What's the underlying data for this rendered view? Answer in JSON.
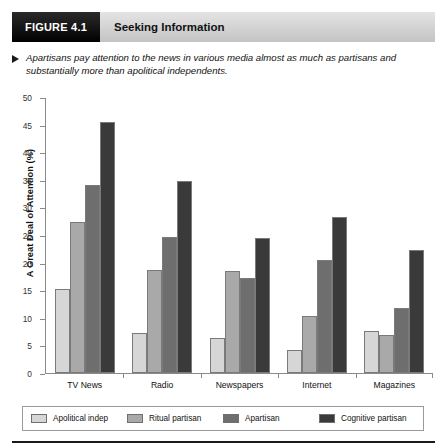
{
  "figure": {
    "tag": "FIGURE 4.1",
    "title": "Seeking Information",
    "caption": "Apartisans pay attention to the news in various media almost as much as partisans and substantially more than apolitical independents."
  },
  "chart_data": {
    "type": "bar",
    "title": "Seeking Information",
    "xlabel": "",
    "ylabel": "A Great Deal of Attention (%)",
    "ylim": [
      0,
      50
    ],
    "yticks": [
      0,
      5,
      10,
      15,
      20,
      25,
      30,
      35,
      40,
      45,
      50
    ],
    "grid": false,
    "legend_position": "bottom",
    "categories": [
      "TV News",
      "Radio",
      "Newspapers",
      "Internet",
      "Magazines"
    ],
    "series": [
      {
        "name": "Apolitical indep",
        "color": "#d6d6d6",
        "values": [
          15.3,
          7.3,
          6.3,
          4.2,
          7.7
        ]
      },
      {
        "name": "Ritual partisan",
        "color": "#a9a9a9",
        "values": [
          27.3,
          18.7,
          18.4,
          10.3,
          6.8
        ]
      },
      {
        "name": "Apartisan",
        "color": "#6e6e6e",
        "values": [
          34.0,
          24.7,
          17.3,
          20.5,
          11.7
        ]
      },
      {
        "name": "Cognitive partisan",
        "color": "#3a3a3a",
        "values": [
          45.4,
          34.8,
          24.4,
          28.2,
          22.2
        ]
      }
    ]
  }
}
